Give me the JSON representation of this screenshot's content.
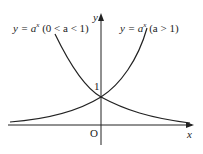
{
  "diagram": {
    "axes": {
      "x_label": "x",
      "y_label": "y",
      "origin_label": "O",
      "y_tick_label": "1"
    },
    "curves": [
      {
        "name": "decreasing",
        "label_prefix": "y = a",
        "label_exp": "x",
        "label_cond": "(0 < a < 1)"
      },
      {
        "name": "increasing",
        "label_prefix": "y = a",
        "label_exp": "x",
        "label_cond": "(a > 1)"
      }
    ],
    "colors": {
      "stroke": "#222222",
      "background": "#ffffff"
    }
  }
}
